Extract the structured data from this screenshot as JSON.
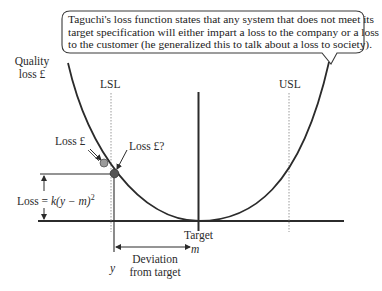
{
  "callout": {
    "lines": [
      "Taguchi's loss function states that any system that does not meet its",
      "target specification will either impart a loss to the company or a loss",
      "to the customer (he generalized this to talk about a loss to society)."
    ]
  },
  "axis": {
    "y_label_line1": "Quality",
    "y_label_line2": "loss £"
  },
  "limits": {
    "lsl": "LSL",
    "usl": "USL"
  },
  "points": {
    "loss_label": "Loss £",
    "loss_question_label": "Loss £?"
  },
  "formula": {
    "prefix": "Loss = ",
    "k": "k",
    "body": "(y − m)",
    "exponent": "2"
  },
  "target": {
    "label": "Target",
    "symbol": "m"
  },
  "deviation": {
    "y_symbol": "y",
    "line1": "Deviation",
    "line2": "from target"
  },
  "colors": {
    "line": "#2b2b2b",
    "dotted": "#9a9a9a",
    "point_light": "#9c9c9c",
    "point_dark": "#555555",
    "box_border": "#3a3a3a"
  }
}
